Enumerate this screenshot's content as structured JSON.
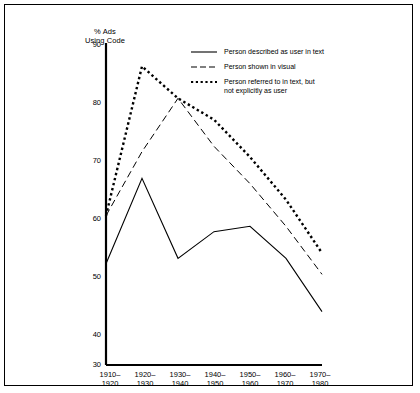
{
  "chart_data": {
    "type": "line",
    "title": "",
    "ylabel": "% Ads\nUsing Code",
    "xlabel": "",
    "ylim": [
      30,
      90
    ],
    "yticks": [
      30,
      40,
      50,
      60,
      70,
      80,
      90
    ],
    "grid": false,
    "legend_position": "top-right",
    "categories": [
      "1910–\n1920",
      "1920–\n1930",
      "1930–\n1940",
      "1940–\n1950",
      "1950–\n1960",
      "1960–\n1970",
      "1970–\n1980"
    ],
    "x": [
      "1910-1920",
      "1920-1930",
      "1930-1940",
      "1940-1950",
      "1950-1960",
      "1960-1970",
      "1970-1980"
    ],
    "series": [
      {
        "name": "Person described as user in text",
        "style": "solid",
        "values": [
          49,
          65,
          50,
          55,
          56,
          50,
          40
        ]
      },
      {
        "name": "Person shown in visual",
        "style": "dashed",
        "values": [
          58,
          70,
          80,
          71,
          64,
          56,
          47
        ]
      },
      {
        "name": "Person referred to in text, but\nnot explicitly as user",
        "style": "dotted",
        "values": [
          58,
          86,
          80,
          76,
          69,
          61,
          51
        ]
      }
    ]
  },
  "yticks_labels": {
    "t90": "90",
    "t80": "80",
    "t70": "70",
    "t60": "60",
    "t50": "50",
    "t40": "40",
    "t30": "30"
  },
  "xticks_labels": {
    "x0": "1910–\n1920",
    "x1": "1920–\n1930",
    "x2": "1930–\n1940",
    "x3": "1940–\n1950",
    "x4": "1950–\n1960",
    "x5": "1960–\n1970",
    "x6": "1970–\n1980"
  },
  "axis": {
    "y_title": "% Ads\nUsing Code"
  },
  "legend": {
    "items": [
      {
        "label": "Person described as user in text",
        "style": "solid"
      },
      {
        "label": "Person shown in visual",
        "style": "dashed"
      },
      {
        "label": "Person referred to in text, but\nnot explicitly as user",
        "style": "dotted"
      }
    ],
    "item0": "Person described as user in text",
    "item1": "Person shown in visual",
    "item2": "Person referred to in text, but\nnot explicitly as user"
  },
  "colors": {
    "ink": "#000000",
    "background": "#ffffff"
  }
}
